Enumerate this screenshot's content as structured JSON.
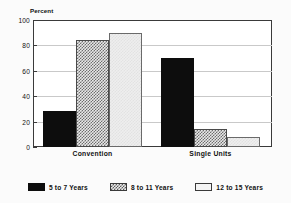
{
  "chart_data": {
    "type": "bar",
    "title": "",
    "subtitle": "",
    "xlabel": "",
    "ylabel": "Percent",
    "ylim": [
      0,
      100
    ],
    "yticks": [
      0,
      20,
      40,
      60,
      80,
      100
    ],
    "ytick_labels": [
      "0",
      "20",
      "40",
      "60",
      "80",
      "100"
    ],
    "grid": true,
    "legend_position": "bottom",
    "categories": [
      "Convention",
      "Single Units"
    ],
    "series": [
      {
        "name": "5 to 7 Years",
        "values": [
          28,
          70
        ],
        "pattern": "solid",
        "color": "#0d0d0d"
      },
      {
        "name": "8 to 11 Years",
        "values": [
          84,
          14
        ],
        "pattern": "hatch",
        "color": "#6e6e6e"
      },
      {
        "name": "12 to 15 Years",
        "values": [
          90,
          8
        ],
        "pattern": "light",
        "color": "#eeeeee"
      }
    ],
    "annotations": []
  },
  "axes": {
    "y_axis_label": "Percent"
  }
}
